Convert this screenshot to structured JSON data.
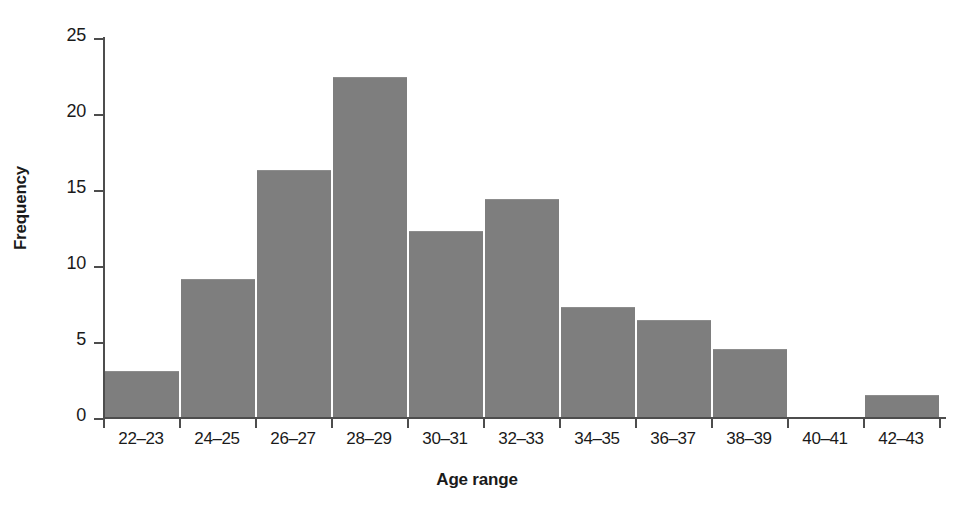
{
  "chart_data": {
    "type": "bar",
    "title": "",
    "xlabel": "Age range",
    "ylabel": "Frequency",
    "categories": [
      "22–23",
      "24–25",
      "26–27",
      "28–29",
      "30–31",
      "32–33",
      "34–35",
      "36–37",
      "38–39",
      "40–41",
      "42–43"
    ],
    "values": [
      3.1,
      9.1,
      16.3,
      22.4,
      12.3,
      14.4,
      7.3,
      6.4,
      4.5,
      0,
      1.5
    ],
    "ylim": [
      0,
      25
    ],
    "ytick_labels": [
      "25",
      "20",
      "15",
      "10",
      "5",
      "0"
    ],
    "ytick_values": [
      25,
      20,
      15,
      10,
      5,
      0
    ],
    "grid": false,
    "legend": null,
    "bar_color": "#7e7e7e",
    "axis_color": "#4d4d4d",
    "background_color": "#ffffff"
  }
}
